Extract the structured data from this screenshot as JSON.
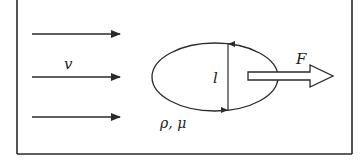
{
  "diagram": {
    "labels": {
      "velocity": "v",
      "length": "l",
      "force": "F",
      "fluid_props": "ρ,  μ"
    },
    "flow_arrows": [
      {
        "y": 34
      },
      {
        "y": 77
      },
      {
        "y": 117
      }
    ],
    "colors": {
      "stroke": "#2a2a2a",
      "background": "#ffffff"
    }
  }
}
